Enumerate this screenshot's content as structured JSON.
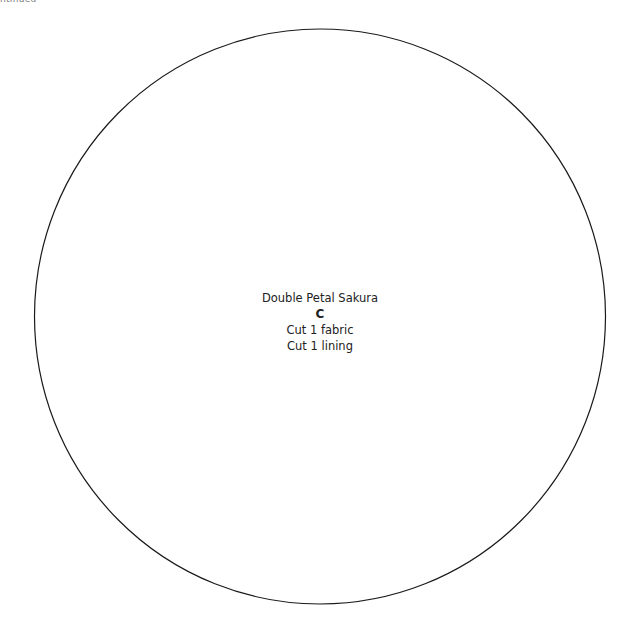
{
  "header": {
    "clipped_text": "ntinued"
  },
  "pattern_piece": {
    "shape": "circle",
    "name": "Double Petal Sakura",
    "letter": "C",
    "instructions": [
      "Cut 1 fabric",
      "Cut 1 lining"
    ],
    "stroke_color": "#1a1a1a"
  }
}
